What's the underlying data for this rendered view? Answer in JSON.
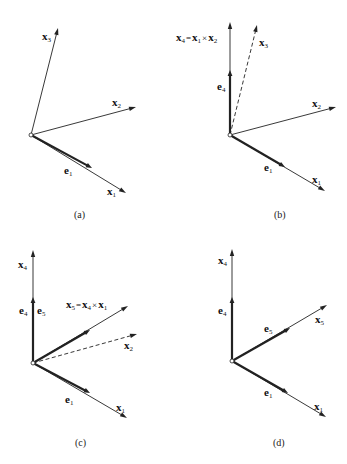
{
  "panels": [
    {
      "id": "a",
      "caption": "(a)",
      "origin": [
        31,
        135
      ],
      "vectors": [
        {
          "name": "x1",
          "label": "x",
          "sub": "1",
          "tip": [
            126,
            193
          ],
          "style": "thin"
        },
        {
          "name": "x2",
          "label": "x",
          "sub": "2",
          "tip": [
            136,
            107
          ],
          "style": "thin"
        },
        {
          "name": "x3",
          "label": "x",
          "sub": "3",
          "tip": [
            58,
            28
          ],
          "style": "thin"
        },
        {
          "name": "e1",
          "label": "e",
          "sub": "1",
          "tip": [
            92,
            168
          ],
          "style": "bold"
        }
      ]
    },
    {
      "id": "b",
      "caption": "(b)",
      "origin": [
        230,
        135
      ],
      "equation": {
        "lhs": "x",
        "lhs_sub": "4",
        "eq": "=",
        "a": "x",
        "a_sub": "1",
        "op": "×",
        "b": "x",
        "b_sub": "2"
      },
      "vectors": [
        {
          "name": "x1",
          "label": "x",
          "sub": "1",
          "tip": [
            325,
            191
          ],
          "style": "thin"
        },
        {
          "name": "x2",
          "label": "x",
          "sub": "2",
          "tip": [
            336,
            107
          ],
          "style": "thin"
        },
        {
          "name": "x3",
          "label": "x",
          "sub": "3",
          "tip": [
            257,
            25
          ],
          "style": "dashed"
        },
        {
          "name": "x4",
          "label": "x",
          "sub": "4",
          "tip": [
            230,
            22
          ],
          "style": "thin"
        },
        {
          "name": "e1",
          "label": "e",
          "sub": "1",
          "tip": [
            285,
            167
          ],
          "style": "bold"
        },
        {
          "name": "e4",
          "label": "e",
          "sub": "4",
          "tip": [
            230,
            70
          ],
          "style": "bold"
        }
      ]
    },
    {
      "id": "c",
      "caption": "(c)",
      "origin": [
        33,
        363
      ],
      "equation": {
        "lhs": "x",
        "lhs_sub": "5",
        "eq": "=",
        "a": "x",
        "a_sub": "4",
        "op": "×",
        "b": "x",
        "b_sub": "1"
      },
      "vectors": [
        {
          "name": "x1",
          "label": "x",
          "sub": "1",
          "tip": [
            127,
            418
          ],
          "style": "thin"
        },
        {
          "name": "x2",
          "label": "x",
          "sub": "2",
          "tip": [
            137,
            334
          ],
          "style": "dashed"
        },
        {
          "name": "x4",
          "label": "x",
          "sub": "4",
          "tip": [
            33,
            250
          ],
          "style": "thin"
        },
        {
          "name": "x5",
          "label": "x",
          "sub": "5",
          "tip": [
            128,
            306
          ],
          "style": "thin"
        },
        {
          "name": "e1",
          "label": "e",
          "sub": "1",
          "tip": [
            90,
            393
          ],
          "style": "bold"
        },
        {
          "name": "e4",
          "label": "e",
          "sub": "4",
          "tip": [
            33,
            297
          ],
          "style": "bold"
        },
        {
          "name": "e5",
          "label": "e",
          "sub": "5",
          "tip": [
            90,
            330
          ],
          "style": "bold"
        }
      ]
    },
    {
      "id": "d",
      "caption": "(d)",
      "origin": [
        232,
        361
      ],
      "vectors": [
        {
          "name": "x1",
          "label": "x",
          "sub": "1",
          "tip": [
            326,
            417
          ],
          "style": "thin"
        },
        {
          "name": "x4",
          "label": "x",
          "sub": "4",
          "tip": [
            232,
            249
          ],
          "style": "thin"
        },
        {
          "name": "x5",
          "label": "x",
          "sub": "5",
          "tip": [
            327,
            305
          ],
          "style": "thin"
        },
        {
          "name": "e1",
          "label": "e",
          "sub": "1",
          "tip": [
            288,
            393
          ],
          "style": "bold"
        },
        {
          "name": "e4",
          "label": "e",
          "sub": "4",
          "tip": [
            232,
            297
          ],
          "style": "bold"
        },
        {
          "name": "e5",
          "label": "e",
          "sub": "5",
          "tip": [
            290,
            328
          ],
          "style": "bold"
        }
      ]
    }
  ],
  "labels": {
    "a": {
      "x1": {
        "t": "x",
        "s": "1"
      },
      "x2": {
        "t": "x",
        "s": "2"
      },
      "x3": {
        "t": "x",
        "s": "3"
      },
      "e1": {
        "t": "e",
        "s": "1"
      },
      "cap": "(a)"
    },
    "b": {
      "x1": {
        "t": "x",
        "s": "1"
      },
      "x2": {
        "t": "x",
        "s": "2"
      },
      "x3": {
        "t": "x",
        "s": "3"
      },
      "e1": {
        "t": "e",
        "s": "1"
      },
      "e4": {
        "t": "e",
        "s": "4"
      },
      "eq": {
        "l": "x",
        "ls": "4",
        "eq": "=",
        "a": "x",
        "as": "1",
        "op": "×",
        "b": "x",
        "bs": "2"
      },
      "cap": "(b)"
    },
    "c": {
      "x1": {
        "t": "x",
        "s": "1"
      },
      "x2": {
        "t": "x",
        "s": "2"
      },
      "x4": {
        "t": "x",
        "s": "4"
      },
      "e1": {
        "t": "e",
        "s": "1"
      },
      "e4": {
        "t": "e",
        "s": "4"
      },
      "e5": {
        "t": "e",
        "s": "5"
      },
      "eq": {
        "l": "x",
        "ls": "5",
        "eq": "=",
        "a": "x",
        "as": "4",
        "op": "×",
        "b": "x",
        "bs": "1"
      },
      "cap": "(c)"
    },
    "d": {
      "x1": {
        "t": "x",
        "s": "1"
      },
      "x4": {
        "t": "x",
        "s": "4"
      },
      "x5": {
        "t": "x",
        "s": "5"
      },
      "e1": {
        "t": "e",
        "s": "1"
      },
      "e4": {
        "t": "e",
        "s": "4"
      },
      "e5": {
        "t": "e",
        "s": "5"
      },
      "cap": "(d)"
    }
  },
  "colors": {
    "stroke": "#222222",
    "background": "#ffffff"
  }
}
